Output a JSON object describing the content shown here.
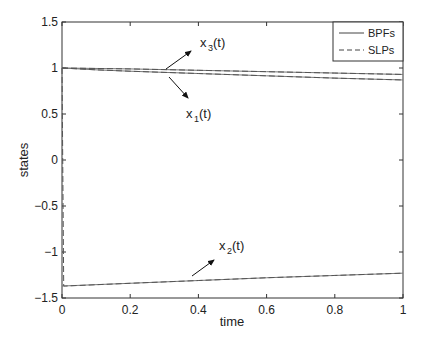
{
  "chart_data": {
    "type": "line",
    "title": "",
    "xlabel": "time",
    "ylabel": "states",
    "xlim": [
      0,
      1
    ],
    "ylim": [
      -1.5,
      1.5
    ],
    "xticks": [
      "0",
      "0.2",
      "0.4",
      "0.6",
      "0.8",
      "1"
    ],
    "yticks": [
      "1.5",
      "1",
      "0.5",
      "0",
      "-0.5",
      "-1",
      "-1.5"
    ],
    "grid": false,
    "legend": {
      "position": "upper right",
      "entries": [
        {
          "label": "BPFs",
          "style": "solid"
        },
        {
          "label": "SLPs",
          "style": "dashed"
        }
      ]
    },
    "series": [
      {
        "name": "x3(t) BPFs",
        "style": "solid",
        "x": [
          0,
          0.2,
          0.4,
          0.6,
          0.8,
          1.0
        ],
        "values": [
          1.0,
          0.99,
          0.975,
          0.96,
          0.945,
          0.93
        ]
      },
      {
        "name": "x1(t) BPFs",
        "style": "solid",
        "x": [
          0,
          0.1,
          0.2,
          0.4,
          0.6,
          0.8,
          1.0
        ],
        "values": [
          1.0,
          0.98,
          0.965,
          0.94,
          0.915,
          0.89,
          0.87
        ]
      },
      {
        "name": "x2(t) BPFs",
        "style": "solid",
        "x": [
          0,
          0.2,
          0.4,
          0.6,
          0.8,
          1.0
        ],
        "values": [
          -1.37,
          -1.34,
          -1.31,
          -1.28,
          -1.255,
          -1.23
        ]
      },
      {
        "name": "x3(t) SLPs",
        "style": "dashed",
        "x": [
          0,
          0.2,
          0.4,
          0.6,
          0.8,
          1.0
        ],
        "values": [
          1.0,
          0.99,
          0.975,
          0.96,
          0.945,
          0.93
        ]
      },
      {
        "name": "x1(t) SLPs",
        "style": "dashed",
        "x": [
          0,
          0.1,
          0.2,
          0.4,
          0.6,
          0.8,
          1.0
        ],
        "values": [
          1.0,
          0.98,
          0.965,
          0.94,
          0.915,
          0.89,
          0.87
        ]
      },
      {
        "name": "x2(t) SLPs",
        "style": "dashed",
        "x": [
          0,
          0.005,
          0.01,
          0.2,
          0.4,
          0.6,
          0.8,
          1.0
        ],
        "values": [
          1.0,
          -1.37,
          -1.37,
          -1.34,
          -1.31,
          -1.28,
          -1.255,
          -1.23
        ]
      }
    ],
    "annotations": [
      {
        "text": "x",
        "sub": "3",
        "suffix": "(t)",
        "arrow_to": "x3 curve near t=0.3"
      },
      {
        "text": "x",
        "sub": "1",
        "suffix": "(t)",
        "arrow_to": "x1 curve near t=0.3"
      },
      {
        "text": "x",
        "sub": "2",
        "suffix": "(t)",
        "arrow_to": "x2 curve near t=0.37"
      }
    ]
  },
  "labels": {
    "xlabel": "time",
    "ylabel": "states",
    "legend_bpf": "BPFs",
    "legend_slp": "SLPs",
    "anno_x": "x",
    "anno_suffix": "(t)",
    "sub1": "1",
    "sub2": "2",
    "sub3": "3"
  }
}
